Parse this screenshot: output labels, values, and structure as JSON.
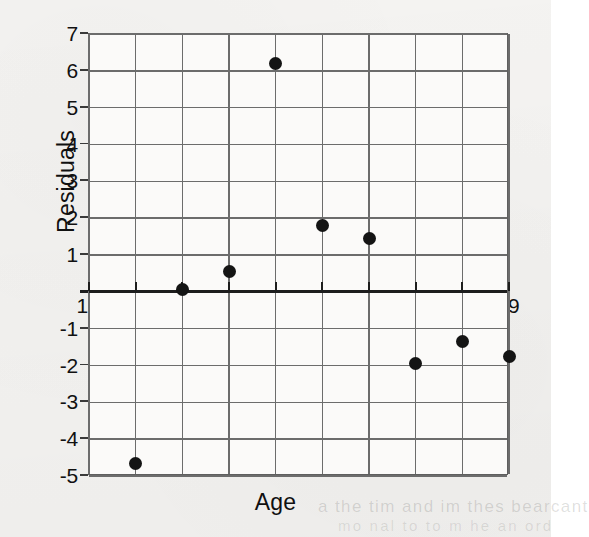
{
  "figure": {
    "background_color": "#f4f3f1",
    "plot_background_color": "#fbfaf9",
    "grid_color": "#6c6c6c",
    "axis_color": "#1d1d1d",
    "point_color": "#141414"
  },
  "chart_data": {
    "type": "scatter",
    "title": "",
    "xlabel": "Age",
    "ylabel": "Residuals",
    "xlim": [
      10,
      19
    ],
    "ylim": [
      -5,
      7
    ],
    "xticks": [
      10,
      11,
      12,
      13,
      14,
      15,
      16,
      17,
      18,
      19
    ],
    "yticks": [
      7,
      6,
      5,
      4,
      3,
      2,
      1,
      -1,
      -2,
      -3,
      -4,
      -5
    ],
    "xtick_labels": [
      "10",
      "11",
      "12",
      "13",
      "14",
      "15",
      "16",
      "17",
      "18",
      "19"
    ],
    "ytick_labels": [
      "7",
      "6",
      "5",
      "4",
      "3",
      "2",
      "1",
      "-1",
      "-2",
      "-3",
      "-4",
      "-5"
    ],
    "grid": true,
    "legend": "none",
    "zero_line": 0,
    "x": [
      11,
      12,
      13,
      14,
      15,
      16,
      17,
      18,
      19
    ],
    "y": [
      -4.65,
      0.05,
      0.55,
      6.2,
      1.8,
      1.45,
      -1.95,
      -1.35,
      -1.75
    ],
    "points": [
      {
        "x": 11,
        "y": -4.65
      },
      {
        "x": 12,
        "y": 0.05
      },
      {
        "x": 13,
        "y": 0.55
      },
      {
        "x": 14,
        "y": 6.2
      },
      {
        "x": 15,
        "y": 1.8
      },
      {
        "x": 16,
        "y": 1.45
      },
      {
        "x": 17,
        "y": -1.95
      },
      {
        "x": 18,
        "y": -1.35
      },
      {
        "x": 19,
        "y": -1.75
      }
    ]
  },
  "artifacts": {
    "bleed_line_1": "a the tim and im thes bearcant",
    "bleed_line_2": "mo nal to to m he an ord"
  }
}
